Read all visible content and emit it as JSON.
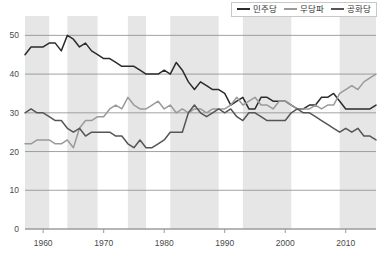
{
  "chart_data": {
    "type": "line",
    "title": "",
    "subtitle": "",
    "xlabel": "",
    "ylabel": "",
    "xlim": [
      1957,
      2015
    ],
    "ylim": [
      0,
      55
    ],
    "yticks": [
      0,
      10,
      20,
      30,
      40,
      50
    ],
    "xticks": [
      1960,
      1970,
      1980,
      1990,
      2000,
      2010
    ],
    "xtick_labels": [
      "1960",
      "1970",
      "1980",
      "1990",
      "2000",
      "2010"
    ],
    "ytick_labels": [
      "0",
      "10",
      "20",
      "30",
      "40",
      "50"
    ],
    "grid": "horizontal",
    "legend_position": "top-right",
    "colors": {
      "democrat": "#2b2b2b",
      "independent": "#9a9a9a",
      "republican": "#555555",
      "grid": "#8c8c8c",
      "band": "#e6e6e6",
      "axis": "#9a9a9a",
      "text": "#4a4a4a"
    },
    "shaded_bands": [
      {
        "start": 1957,
        "end": 1961
      },
      {
        "start": 1964,
        "end": 1969
      },
      {
        "start": 1974,
        "end": 1977
      },
      {
        "start": 1981,
        "end": 1989
      },
      {
        "start": 1993,
        "end": 2001
      },
      {
        "start": 2009,
        "end": 2015
      }
    ],
    "series": [
      {
        "name": "민주당",
        "color": "#2b2b2b",
        "x": [
          1957,
          1958,
          1959,
          1960,
          1961,
          1962,
          1963,
          1964,
          1965,
          1966,
          1967,
          1968,
          1969,
          1970,
          1971,
          1972,
          1973,
          1974,
          1975,
          1976,
          1977,
          1978,
          1979,
          1980,
          1981,
          1982,
          1983,
          1984,
          1985,
          1986,
          1987,
          1988,
          1989,
          1990,
          1991,
          1992,
          1993,
          1994,
          1995,
          1996,
          1997,
          1998,
          1999,
          2000,
          2001,
          2002,
          2003,
          2004,
          2005,
          2006,
          2007,
          2008,
          2009,
          2010,
          2011,
          2012,
          2013,
          2014,
          2015
        ],
        "y": [
          45,
          47,
          47,
          47,
          48,
          48,
          46,
          50,
          49,
          47,
          48,
          46,
          45,
          44,
          44,
          43,
          42,
          42,
          42,
          41,
          40,
          40,
          40,
          41,
          40,
          43,
          41,
          38,
          36,
          38,
          37,
          36,
          36,
          35,
          32,
          33,
          34,
          31,
          31,
          34,
          34,
          33,
          33,
          33,
          32,
          31,
          31,
          32,
          32,
          34,
          34,
          35,
          33,
          31,
          31,
          31,
          31,
          31,
          32
        ]
      },
      {
        "name": "무당파",
        "color": "#9a9a9a",
        "x": [
          1957,
          1958,
          1959,
          1960,
          1961,
          1962,
          1963,
          1964,
          1965,
          1966,
          1967,
          1968,
          1969,
          1970,
          1971,
          1972,
          1973,
          1974,
          1975,
          1976,
          1977,
          1978,
          1979,
          1980,
          1981,
          1982,
          1983,
          1984,
          1985,
          1986,
          1987,
          1988,
          1989,
          1990,
          1991,
          1992,
          1993,
          1994,
          1995,
          1996,
          1997,
          1998,
          1999,
          2000,
          2001,
          2002,
          2003,
          2004,
          2005,
          2006,
          2007,
          2008,
          2009,
          2010,
          2011,
          2012,
          2013,
          2014,
          2015
        ],
        "y": [
          22,
          22,
          23,
          23,
          23,
          22,
          22,
          23,
          21,
          26,
          28,
          28,
          29,
          29,
          31,
          32,
          31,
          34,
          32,
          31,
          31,
          32,
          33,
          31,
          32,
          30,
          31,
          30,
          31,
          31,
          30,
          31,
          31,
          31,
          32,
          34,
          32,
          33,
          34,
          32,
          32,
          31,
          33,
          33,
          32,
          31,
          31,
          31,
          32,
          31,
          32,
          32,
          35,
          36,
          37,
          36,
          38,
          39,
          40
        ]
      },
      {
        "name": "공화당",
        "color": "#555555",
        "x": [
          1957,
          1958,
          1959,
          1960,
          1961,
          1962,
          1963,
          1964,
          1965,
          1966,
          1967,
          1968,
          1969,
          1970,
          1971,
          1972,
          1973,
          1974,
          1975,
          1976,
          1977,
          1978,
          1979,
          1980,
          1981,
          1982,
          1983,
          1984,
          1985,
          1986,
          1987,
          1988,
          1989,
          1990,
          1991,
          1992,
          1993,
          1994,
          1995,
          1996,
          1997,
          1998,
          1999,
          2000,
          2001,
          2002,
          2003,
          2004,
          2005,
          2006,
          2007,
          2008,
          2009,
          2010,
          2011,
          2012,
          2013,
          2014,
          2015
        ],
        "y": [
          30,
          31,
          30,
          30,
          29,
          28,
          28,
          26,
          25,
          26,
          24,
          25,
          25,
          25,
          25,
          24,
          24,
          22,
          21,
          23,
          21,
          21,
          22,
          23,
          25,
          25,
          25,
          30,
          32,
          30,
          29,
          30,
          31,
          30,
          31,
          29,
          28,
          30,
          30,
          29,
          28,
          28,
          28,
          28,
          30,
          31,
          30,
          30,
          29,
          28,
          27,
          26,
          25,
          26,
          25,
          26,
          24,
          24,
          23
        ]
      }
    ],
    "legend": [
      {
        "label": "민주당",
        "color": "#2b2b2b"
      },
      {
        "label": "무당파",
        "color": "#9a9a9a"
      },
      {
        "label": "공화당",
        "color": "#555555"
      }
    ]
  }
}
